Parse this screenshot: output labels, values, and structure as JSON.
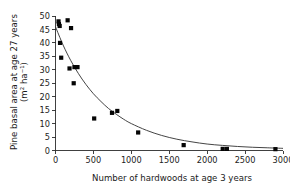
{
  "chart_data": {
    "type": "scatter",
    "title": "",
    "xlabel": "Number of hardwoods at age 3 years",
    "ylabel_line1": "Pine basal area at age 27 years",
    "ylabel_line2": "(m² ha⁻¹)",
    "xlim": [
      0,
      3000
    ],
    "ylim": [
      0,
      50
    ],
    "xticks": [
      0,
      500,
      1000,
      1500,
      2000,
      2500,
      3000
    ],
    "xtick_labels": [
      "0",
      "500",
      "1000",
      "1500",
      "2000",
      "2500",
      "3000"
    ],
    "yticks": [
      0,
      5,
      10,
      15,
      20,
      25,
      30,
      35,
      40,
      45,
      50
    ],
    "ytick_labels": [
      "0",
      "5",
      "10",
      "15",
      "20",
      "25",
      "30",
      "35",
      "40",
      "45",
      "50"
    ],
    "grid": false,
    "legend": "none",
    "marker": "filled-square",
    "marker_color": "#050505",
    "marker_size_px": 4.2,
    "curve_color": "#3a3a3a",
    "points": [
      {
        "x": 40,
        "y": 48.0
      },
      {
        "x": 45,
        "y": 47.0
      },
      {
        "x": 55,
        "y": 46.3
      },
      {
        "x": 60,
        "y": 40.0
      },
      {
        "x": 75,
        "y": 34.5
      },
      {
        "x": 160,
        "y": 48.4
      },
      {
        "x": 205,
        "y": 45.5
      },
      {
        "x": 185,
        "y": 30.5
      },
      {
        "x": 250,
        "y": 31.0
      },
      {
        "x": 290,
        "y": 31.0
      },
      {
        "x": 240,
        "y": 25.0
      },
      {
        "x": 510,
        "y": 11.9
      },
      {
        "x": 745,
        "y": 14.0
      },
      {
        "x": 815,
        "y": 14.7
      },
      {
        "x": 1090,
        "y": 6.7
      },
      {
        "x": 1690,
        "y": 2.0
      },
      {
        "x": 2205,
        "y": 0.6
      },
      {
        "x": 2260,
        "y": 0.6
      },
      {
        "x": 2900,
        "y": 0.5
      }
    ],
    "fit_curve": {
      "description": "exponential-decay fitted line",
      "samples": [
        {
          "x": 0,
          "y": 46.0
        },
        {
          "x": 100,
          "y": 39.2
        },
        {
          "x": 200,
          "y": 33.5
        },
        {
          "x": 300,
          "y": 28.7
        },
        {
          "x": 400,
          "y": 24.6
        },
        {
          "x": 500,
          "y": 21.1
        },
        {
          "x": 600,
          "y": 18.2
        },
        {
          "x": 700,
          "y": 15.6
        },
        {
          "x": 800,
          "y": 13.5
        },
        {
          "x": 900,
          "y": 11.6
        },
        {
          "x": 1000,
          "y": 10.0
        },
        {
          "x": 1200,
          "y": 7.5
        },
        {
          "x": 1400,
          "y": 5.6
        },
        {
          "x": 1600,
          "y": 4.2
        },
        {
          "x": 1800,
          "y": 3.2
        },
        {
          "x": 2000,
          "y": 2.4
        },
        {
          "x": 2200,
          "y": 1.9
        },
        {
          "x": 2400,
          "y": 1.5
        },
        {
          "x": 2600,
          "y": 1.2
        },
        {
          "x": 2800,
          "y": 1.0
        },
        {
          "x": 3000,
          "y": 0.8
        }
      ]
    }
  }
}
